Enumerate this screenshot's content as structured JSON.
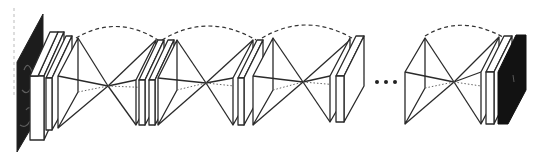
{
  "diagram": {
    "type": "stacked-hourglass-network",
    "colors": {
      "line": "#2a2a2a",
      "fill": "#ffffff",
      "input_image": "#1a1a1a",
      "output_heatmap": "#111111"
    },
    "nodes": [
      {
        "id": "input-image",
        "kind": "image",
        "label": ""
      },
      {
        "id": "hourglass-1",
        "kind": "hourglass",
        "label": ""
      },
      {
        "id": "hourglass-2",
        "kind": "hourglass",
        "label": ""
      },
      {
        "id": "hourglass-3",
        "kind": "hourglass",
        "label": ""
      },
      {
        "id": "hourglass-n",
        "kind": "hourglass",
        "label": ""
      },
      {
        "id": "output-heatmap",
        "kind": "image",
        "label": ""
      }
    ],
    "ellipsis": "• • •"
  }
}
